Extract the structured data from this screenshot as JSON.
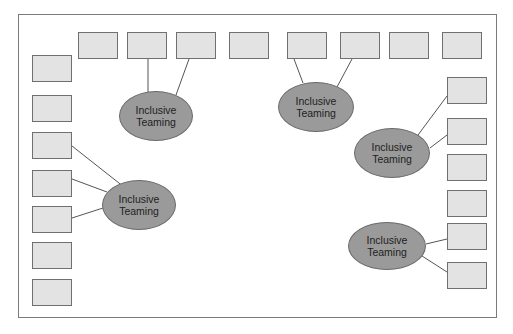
{
  "diagram": {
    "frame": {
      "x": 18,
      "y": 14,
      "w": 479,
      "h": 304
    },
    "colors": {
      "box_fill": "#e3e3e3",
      "box_border": "#707070",
      "ellipse_fill": "#9a9a9a",
      "ellipse_border": "#6a6a6a",
      "line": "#555555"
    },
    "boxes": [
      {
        "id": "top-1",
        "x": 78,
        "y": 32
      },
      {
        "id": "top-2",
        "x": 127,
        "y": 32
      },
      {
        "id": "top-3",
        "x": 176,
        "y": 32
      },
      {
        "id": "top-4",
        "x": 229,
        "y": 32
      },
      {
        "id": "top-5",
        "x": 287,
        "y": 32
      },
      {
        "id": "top-6",
        "x": 340,
        "y": 32
      },
      {
        "id": "top-7",
        "x": 389,
        "y": 32
      },
      {
        "id": "top-8",
        "x": 442,
        "y": 32
      },
      {
        "id": "left-1",
        "x": 32,
        "y": 55
      },
      {
        "id": "left-2",
        "x": 32,
        "y": 95
      },
      {
        "id": "left-3",
        "x": 32,
        "y": 132
      },
      {
        "id": "left-4",
        "x": 32,
        "y": 170
      },
      {
        "id": "left-5",
        "x": 32,
        "y": 206
      },
      {
        "id": "left-6",
        "x": 32,
        "y": 242
      },
      {
        "id": "left-7",
        "x": 32,
        "y": 279
      },
      {
        "id": "right-1",
        "x": 447,
        "y": 77
      },
      {
        "id": "right-2",
        "x": 447,
        "y": 118
      },
      {
        "id": "right-3",
        "x": 447,
        "y": 154
      },
      {
        "id": "right-4",
        "x": 447,
        "y": 190
      },
      {
        "id": "right-5",
        "x": 447,
        "y": 223
      },
      {
        "id": "right-6",
        "x": 447,
        "y": 262
      }
    ],
    "ellipses": [
      {
        "id": "team-1",
        "label": "Inclusive\nTeaming",
        "cx": 156,
        "cy": 116,
        "rx": 37,
        "ry": 25
      },
      {
        "id": "team-2",
        "label": "Inclusive\nTeaming",
        "cx": 139,
        "cy": 205,
        "rx": 37,
        "ry": 25
      },
      {
        "id": "team-3",
        "label": "Inclusive\nTeaming",
        "cx": 316,
        "cy": 107,
        "rx": 38,
        "ry": 25
      },
      {
        "id": "team-4",
        "label": "Inclusive\nTeaming",
        "cx": 392,
        "cy": 153,
        "rx": 38,
        "ry": 25
      },
      {
        "id": "team-5",
        "label": "Inclusive\nTeaming",
        "cx": 387,
        "cy": 246,
        "rx": 39,
        "ry": 24
      }
    ],
    "connectors": [
      {
        "from": "top-2",
        "to": "team-1",
        "x1": 148,
        "y1": 59,
        "x2": 148,
        "y2": 92
      },
      {
        "from": "top-3",
        "to": "team-1",
        "x1": 189,
        "y1": 59,
        "x2": 176,
        "y2": 95
      },
      {
        "from": "top-5",
        "to": "team-3",
        "x1": 294,
        "y1": 59,
        "x2": 303,
        "y2": 83
      },
      {
        "from": "top-6",
        "to": "team-3",
        "x1": 352,
        "y1": 59,
        "x2": 337,
        "y2": 87
      },
      {
        "from": "left-3",
        "to": "team-2",
        "x1": 72,
        "y1": 146,
        "x2": 124,
        "y2": 187
      },
      {
        "from": "left-4",
        "to": "team-2",
        "x1": 72,
        "y1": 179,
        "x2": 107,
        "y2": 192
      },
      {
        "from": "left-5",
        "to": "team-2",
        "x1": 72,
        "y1": 218,
        "x2": 103,
        "y2": 208
      },
      {
        "from": "right-1",
        "to": "team-4",
        "x1": 447,
        "y1": 96,
        "x2": 418,
        "y2": 135
      },
      {
        "from": "right-2",
        "to": "team-4",
        "x1": 447,
        "y1": 135,
        "x2": 430,
        "y2": 148
      },
      {
        "from": "right-5",
        "to": "team-5",
        "x1": 447,
        "y1": 239,
        "x2": 426,
        "y2": 244
      },
      {
        "from": "right-6",
        "to": "team-5",
        "x1": 447,
        "y1": 272,
        "x2": 422,
        "y2": 256
      }
    ]
  }
}
